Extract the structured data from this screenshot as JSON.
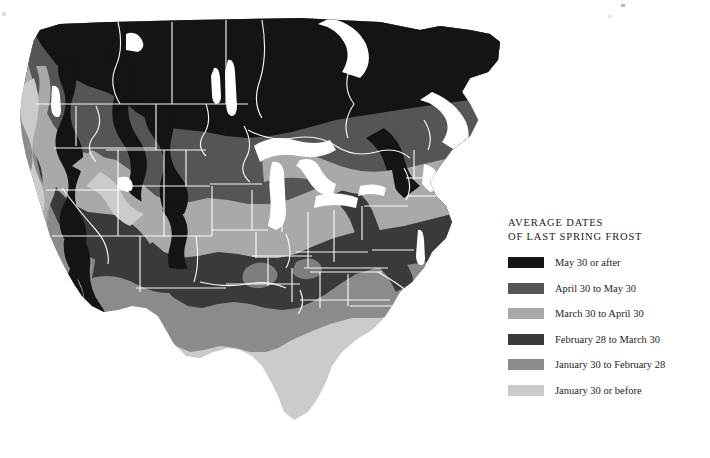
{
  "figure": {
    "background_color": "#ffffff",
    "width": 710,
    "height": 458
  },
  "legend": {
    "title_line1": "AVERAGE DATES",
    "title_line2": "OF LAST SPRING FROST",
    "entries": [
      {
        "label": "May 30 or after",
        "color": "#151515"
      },
      {
        "label": "April 30 to May 30",
        "color": "#565656"
      },
      {
        "label": "March 30 to April 30",
        "color": "#a9a9a9"
      },
      {
        "label": "February 28 to March 30",
        "color": "#3a3a3a"
      },
      {
        "label": "January 30 to February 28",
        "color": "#8c8c8c"
      },
      {
        "label": "January 30 or before",
        "color": "#cbcbcb"
      }
    ]
  },
  "map": {
    "type": "choropleth",
    "subject": "North America — average date of last spring frost",
    "water_color": "#ffffff",
    "border_color": "#ffffff",
    "zones": [
      {
        "name": "may-30-or-after",
        "color": "#151515",
        "regions": "Canada, northern Great Lakes, northern New England, high Rockies, Cascades and Sierra Nevada crests"
      },
      {
        "name": "april-30-to-may-30",
        "color": "#565656",
        "regions": "Northern Plains, upper Midwest, interior Northwest, northern Appalachians"
      },
      {
        "name": "march-30-to-april-30",
        "color": "#a9a9a9",
        "regions": "Central Plains, Ohio Valley, mid-Atlantic, Great Basin, Central Valley"
      },
      {
        "name": "february-28-to-march-30",
        "color": "#3a3a3a",
        "regions": "Southern Appalachians, mid-South, Oklahoma, northern Texas, desert Southwest"
      },
      {
        "name": "january-30-to-february-28",
        "color": "#8c8c8c",
        "regions": "Gulf Coast, Carolina coast, southern Texas, southern California coast"
      },
      {
        "name": "january-30-or-before",
        "color": "#cbcbcb",
        "regions": "Peninsular Florida, extreme south Texas, Pacific coastal fringe"
      }
    ]
  }
}
